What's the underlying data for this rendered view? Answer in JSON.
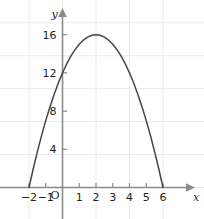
{
  "chart_data": {
    "type": "line",
    "title": "",
    "subtitle": "",
    "xlabel": "x",
    "ylabel": "y",
    "origin_label": "O",
    "xlim": [
      -2.8,
      7.0
    ],
    "ylim": [
      -1.2,
      18.0
    ],
    "grid": true,
    "grid_color": "#eceaea",
    "legend": null,
    "axis_color": "#8b8b8b",
    "curve_color": "#4a4448",
    "text_color": "#231f20",
    "xticks": [
      -2,
      -1,
      1,
      2,
      3,
      4,
      5,
      6
    ],
    "xtick_labels": [
      "−2",
      "−1",
      "1",
      "2",
      "3",
      "4",
      "5",
      "6"
    ],
    "yticks": [
      4,
      8,
      12,
      16
    ],
    "ytick_labels": [
      "4",
      "8",
      "12",
      "16"
    ],
    "series": [
      {
        "name": "y = -x^2 + 4x + 12",
        "equation": "y = -(x+2)(x-6)",
        "vertex": [
          2,
          16
        ],
        "roots": [
          -2,
          6
        ],
        "y_intercept": 12,
        "x": [
          -2,
          -1.75,
          -1.5,
          -1.25,
          -1,
          -0.75,
          -0.5,
          -0.25,
          0,
          0.25,
          0.5,
          0.75,
          1,
          1.25,
          1.5,
          1.75,
          2,
          2.25,
          2.5,
          2.75,
          3,
          3.25,
          3.5,
          3.75,
          4,
          4.25,
          4.5,
          4.75,
          5,
          5.25,
          5.5,
          5.75,
          6
        ],
        "y": [
          0,
          1.9375,
          3.75,
          5.4375,
          7,
          8.4375,
          9.75,
          10.9375,
          12,
          12.9375,
          13.75,
          14.4375,
          15,
          15.4375,
          15.75,
          15.9375,
          16,
          15.9375,
          15.75,
          15.4375,
          15,
          14.4375,
          13.75,
          12.9375,
          12,
          10.9375,
          9.75,
          8.4375,
          7,
          5.4375,
          3.75,
          1.9375,
          0
        ]
      }
    ]
  }
}
